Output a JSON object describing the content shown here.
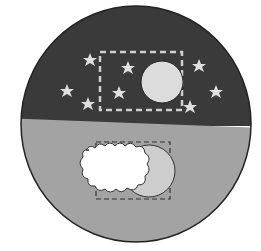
{
  "illustration": {
    "subject": "day-night-circle",
    "night_half": {
      "fill": "#3a3a3a",
      "moon": {
        "cx": 162,
        "cy": 82,
        "r": 21,
        "fill": "#dcdcdc"
      },
      "frame": {
        "x": 100,
        "y": 52,
        "w": 82,
        "h": 58,
        "stroke": "#cfcfcf"
      },
      "stars": [
        {
          "x": 90,
          "y": 60
        },
        {
          "x": 128,
          "y": 68
        },
        {
          "x": 199,
          "y": 66
        },
        {
          "x": 67,
          "y": 91
        },
        {
          "x": 119,
          "y": 93
        },
        {
          "x": 216,
          "y": 92
        },
        {
          "x": 88,
          "y": 104
        },
        {
          "x": 190,
          "y": 107
        }
      ],
      "star_fill": "#e0e0e0"
    },
    "day_half": {
      "fill": "#a3a3a3",
      "sun": {
        "cx": 149,
        "cy": 171,
        "r": 26,
        "fill": "#cdcdcd"
      },
      "frame": {
        "x": 96,
        "y": 142,
        "w": 74,
        "h": 57,
        "stroke": "#333333"
      },
      "cloud_fill": "#ffffff"
    }
  }
}
